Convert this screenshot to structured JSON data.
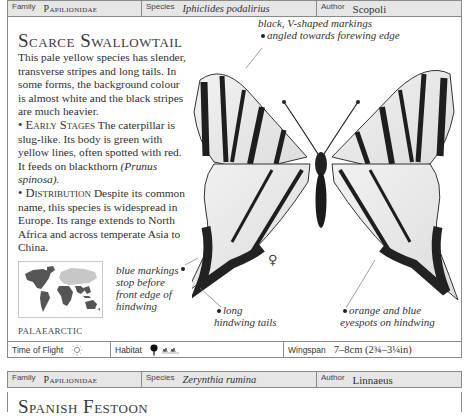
{
  "entry1": {
    "header": {
      "family_label": "Family",
      "family_value": "Papilionidae",
      "species_label": "Species",
      "species_value": "Iphiclides podalirius",
      "author_label": "Author",
      "author_value": "Scopoli"
    },
    "title": "Scarce Swallowtail",
    "intro": "This pale yellow species has slender, transverse stripes and long tails. In some forms, the background colour is almost white and the black stripes are much heavier.",
    "early_stages_heading": "• Early Stages",
    "early_stages_text": " The caterpillar is slug-like. Its body is green with yellow lines, often spotted with red. It feeds on blackthorn ",
    "early_stages_plant": "(Prunus spinosa).",
    "distribution_heading": "• Distribution",
    "distribution_text": " Despite its common name, this species is widespread in Europe. Its range extends to North Africa and across temperate Asia to China.",
    "map_region_label": "PALAEARCTIC",
    "annotations": {
      "forewing_line1": "black, V-shaped markings",
      "forewing_line2": "angled towards forewing edge",
      "blue_markings": "blue markings stop before front edge of hindwing",
      "tails_line1": "long",
      "tails_line2": "hindwing tails",
      "eyespots_line1": "orange and blue",
      "eyespots_line2": "eyespots on hindwing"
    },
    "sex_symbol": "♀",
    "footer": {
      "time_of_flight_label": "Time of Flight",
      "time_of_flight_icon": "sun-icon",
      "habitat_label": "Habitat",
      "habitat_icons": [
        "tree-icon",
        "grassland-icon"
      ],
      "wingspan_label": "Wingspan",
      "wingspan_value": "7–8cm (2¾–3¼in)"
    }
  },
  "entry2": {
    "header": {
      "family_label": "Family",
      "family_value": "Papilionidae",
      "species_label": "Species",
      "species_value": "Zerynthia rumina",
      "author_label": "Author",
      "author_value": "Linnaeus"
    },
    "title": "Spanish Festoon"
  }
}
